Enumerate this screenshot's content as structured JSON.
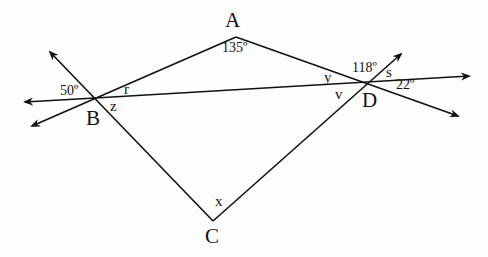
{
  "diagram": {
    "points": {
      "A": {
        "label": "A",
        "x": 236,
        "y": 37
      },
      "B": {
        "label": "B",
        "x": 95,
        "y": 98
      },
      "C": {
        "label": "C",
        "x": 213,
        "y": 221
      },
      "D": {
        "label": "D",
        "x": 366,
        "y": 83
      }
    },
    "angles": {
      "angle_A": "135º",
      "angle_B_outer": "50º",
      "angle_D_upper": "118º",
      "angle_D_right": "22º"
    },
    "variables": {
      "r": "r",
      "z": "z",
      "y": "y",
      "v": "v",
      "s": "s",
      "x": "x"
    },
    "line_color": "#111111"
  }
}
